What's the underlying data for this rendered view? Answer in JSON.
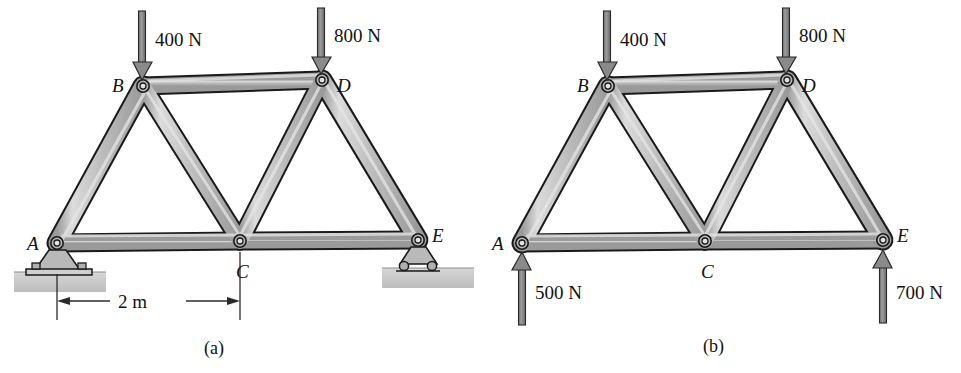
{
  "figure": {
    "panels": [
      {
        "id": "a",
        "caption": "(a)",
        "joint_labels": [
          {
            "name": "A",
            "text": "A"
          },
          {
            "name": "B",
            "text": "B"
          },
          {
            "name": "C",
            "text": "C"
          },
          {
            "name": "D",
            "text": "D"
          },
          {
            "name": "E",
            "text": "E"
          }
        ],
        "loads": [
          {
            "name": "load-at-B",
            "text": "400 N",
            "direction": "down",
            "at_joint": "B"
          },
          {
            "name": "load-at-D",
            "text": "800 N",
            "direction": "down",
            "at_joint": "D"
          }
        ],
        "dimensions": [
          {
            "name": "span-A-C",
            "text": "2 m",
            "from": "A",
            "to": "C"
          }
        ],
        "supports": [
          {
            "name": "pin-support-A",
            "type": "pin",
            "at_joint": "A"
          },
          {
            "name": "roller-support-E",
            "type": "roller",
            "at_joint": "E"
          }
        ]
      },
      {
        "id": "b",
        "caption": "(b)",
        "joint_labels": [
          {
            "name": "A",
            "text": "A"
          },
          {
            "name": "B",
            "text": "B"
          },
          {
            "name": "C",
            "text": "C"
          },
          {
            "name": "D",
            "text": "D"
          },
          {
            "name": "E",
            "text": "E"
          }
        ],
        "loads": [
          {
            "name": "load-at-B",
            "text": "400 N",
            "direction": "down",
            "at_joint": "B"
          },
          {
            "name": "load-at-D",
            "text": "800 N",
            "direction": "down",
            "at_joint": "D"
          }
        ],
        "reactions": [
          {
            "name": "reaction-at-A",
            "text": "500 N",
            "direction": "up",
            "at_joint": "A"
          },
          {
            "name": "reaction-at-E",
            "text": "700 N",
            "direction": "up",
            "at_joint": "E"
          }
        ],
        "supports": []
      }
    ],
    "colors": {
      "background": "#ffffff",
      "member_fill": "#b0b0b0",
      "member_highlight": "#d8d8d8",
      "member_shadow": "#8e8e8e",
      "member_stroke": "#1a1a1a",
      "arrow_fill": "#8a8a8a",
      "arrow_stroke": "#2a2a2a",
      "ground_fill": "#c9c9c9",
      "text": "#111111"
    }
  }
}
